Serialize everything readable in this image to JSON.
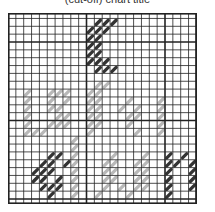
{
  "caption": "(cut-off) chart title",
  "grid": {
    "cols": 24,
    "rows": 24,
    "cell": 7.85,
    "offset_y": -2.4,
    "major_every": 10,
    "major_col_start": 0,
    "major_row_start": 4,
    "line_color": "#222222",
    "minor_width": 0.8,
    "major_width": 1.6
  },
  "colors": {
    "dark": "#333333",
    "light": "#b8b8b8"
  },
  "stitches": [
    [
      11,
      1,
      "dark"
    ],
    [
      12,
      1,
      "dark"
    ],
    [
      13,
      1,
      "dark"
    ],
    [
      10,
      2,
      "dark"
    ],
    [
      11,
      2,
      "dark"
    ],
    [
      12,
      2,
      "dark"
    ],
    [
      10,
      3,
      "dark"
    ],
    [
      11,
      3,
      "dark"
    ],
    [
      10,
      4,
      "dark"
    ],
    [
      11,
      4,
      "dark"
    ],
    [
      10,
      5,
      "dark"
    ],
    [
      11,
      5,
      "dark"
    ],
    [
      10,
      6,
      "dark"
    ],
    [
      11,
      6,
      "dark"
    ],
    [
      12,
      6,
      "dark"
    ],
    [
      11,
      7,
      "dark"
    ],
    [
      12,
      7,
      "dark"
    ],
    [
      13,
      7,
      "dark"
    ],
    [
      2,
      10,
      "light"
    ],
    [
      5,
      10,
      "light"
    ],
    [
      6,
      10,
      "light"
    ],
    [
      7,
      10,
      "light"
    ],
    [
      2,
      11,
      "light"
    ],
    [
      5,
      11,
      "light"
    ],
    [
      7,
      11,
      "light"
    ],
    [
      2,
      12,
      "light"
    ],
    [
      5,
      12,
      "light"
    ],
    [
      6,
      12,
      "light"
    ],
    [
      2,
      13,
      "light"
    ],
    [
      6,
      13,
      "light"
    ],
    [
      7,
      13,
      "light"
    ],
    [
      2,
      14,
      "light"
    ],
    [
      5,
      14,
      "light"
    ],
    [
      6,
      14,
      "light"
    ],
    [
      7,
      14,
      "light"
    ],
    [
      2,
      15,
      "light"
    ],
    [
      3,
      15,
      "light"
    ],
    [
      4,
      15,
      "light"
    ],
    [
      11,
      9,
      "light"
    ],
    [
      12,
      9,
      "light"
    ],
    [
      10,
      10,
      "light"
    ],
    [
      11,
      10,
      "light"
    ],
    [
      10,
      11,
      "light"
    ],
    [
      11,
      11,
      "light"
    ],
    [
      15,
      11,
      "light"
    ],
    [
      19,
      11,
      "light"
    ],
    [
      10,
      12,
      "light"
    ],
    [
      11,
      12,
      "light"
    ],
    [
      14,
      12,
      "light"
    ],
    [
      16,
      12,
      "light"
    ],
    [
      19,
      12,
      "light"
    ],
    [
      10,
      13,
      "light"
    ],
    [
      11,
      13,
      "light"
    ],
    [
      15,
      13,
      "light"
    ],
    [
      16,
      13,
      "light"
    ],
    [
      19,
      13,
      "light"
    ],
    [
      10,
      14,
      "light"
    ],
    [
      11,
      14,
      "light"
    ],
    [
      15,
      14,
      "light"
    ],
    [
      19,
      14,
      "light"
    ],
    [
      10,
      15,
      "light"
    ],
    [
      16,
      15,
      "light"
    ],
    [
      19,
      15,
      "light"
    ],
    [
      8,
      16,
      "light"
    ],
    [
      8,
      17,
      "light"
    ],
    [
      8,
      18,
      "light"
    ],
    [
      8,
      19,
      "light"
    ],
    [
      8,
      20,
      "light"
    ],
    [
      8,
      21,
      "light"
    ],
    [
      8,
      22,
      "light"
    ],
    [
      8,
      23,
      "light"
    ],
    [
      13,
      18,
      "light"
    ],
    [
      17,
      18,
      "light"
    ],
    [
      12,
      19,
      "light"
    ],
    [
      13,
      19,
      "light"
    ],
    [
      16,
      19,
      "light"
    ],
    [
      17,
      19,
      "light"
    ],
    [
      12,
      20,
      "light"
    ],
    [
      13,
      20,
      "light"
    ],
    [
      16,
      20,
      "light"
    ],
    [
      17,
      20,
      "light"
    ],
    [
      12,
      21,
      "light"
    ],
    [
      13,
      21,
      "light"
    ],
    [
      16,
      21,
      "light"
    ],
    [
      17,
      21,
      "light"
    ],
    [
      12,
      22,
      "light"
    ],
    [
      14,
      22,
      "light"
    ],
    [
      16,
      22,
      "light"
    ],
    [
      17,
      22,
      "light"
    ],
    [
      11,
      23,
      "light"
    ],
    [
      15,
      23,
      "light"
    ],
    [
      5,
      18,
      "dark"
    ],
    [
      6,
      18,
      "dark"
    ],
    [
      4,
      19,
      "dark"
    ],
    [
      5,
      19,
      "dark"
    ],
    [
      7,
      19,
      "dark"
    ],
    [
      3,
      20,
      "dark"
    ],
    [
      4,
      20,
      "dark"
    ],
    [
      5,
      20,
      "dark"
    ],
    [
      3,
      21,
      "dark"
    ],
    [
      4,
      21,
      "dark"
    ],
    [
      6,
      21,
      "dark"
    ],
    [
      4,
      22,
      "dark"
    ],
    [
      5,
      22,
      "dark"
    ],
    [
      6,
      22,
      "dark"
    ],
    [
      5,
      23,
      "dark"
    ],
    [
      20,
      18,
      "dark"
    ],
    [
      22,
      18,
      "dark"
    ],
    [
      20,
      19,
      "dark"
    ],
    [
      21,
      19,
      "dark"
    ],
    [
      23,
      19,
      "dark"
    ],
    [
      20,
      20,
      "dark"
    ],
    [
      23,
      20,
      "dark"
    ],
    [
      20,
      21,
      "dark"
    ],
    [
      23,
      21,
      "dark"
    ],
    [
      20,
      22,
      "dark"
    ],
    [
      23,
      22,
      "dark"
    ],
    [
      20,
      23,
      "dark"
    ]
  ]
}
